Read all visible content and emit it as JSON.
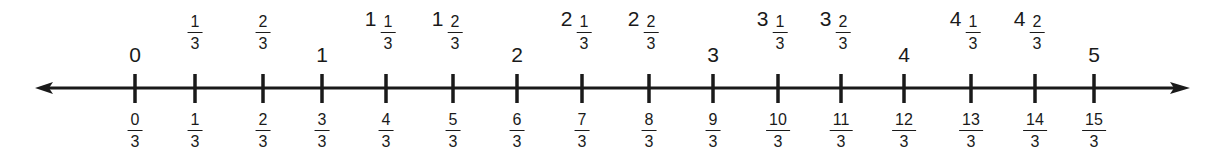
{
  "numberline": {
    "axis": {
      "y": 88,
      "x_start": 35,
      "x_end": 1190,
      "min": 0,
      "max": 5,
      "step": "1/3",
      "color": "#1a1a1a"
    },
    "ticks": [
      {
        "x": 135,
        "above": {
          "type": "whole",
          "whole": "0"
        },
        "below": {
          "num": "0",
          "den": "3"
        }
      },
      {
        "x": 195,
        "above": {
          "type": "frac",
          "num": "1",
          "den": "3"
        },
        "below": {
          "num": "1",
          "den": "3"
        }
      },
      {
        "x": 263,
        "above": {
          "type": "frac",
          "num": "2",
          "den": "3"
        },
        "below": {
          "num": "2",
          "den": "3"
        }
      },
      {
        "x": 322,
        "above": {
          "type": "whole",
          "whole": "1"
        },
        "below": {
          "num": "3",
          "den": "3"
        }
      },
      {
        "x": 386,
        "above": {
          "type": "mixed",
          "whole": "1",
          "num": "1",
          "den": "3"
        },
        "below": {
          "num": "4",
          "den": "3"
        }
      },
      {
        "x": 453,
        "above": {
          "type": "mixed",
          "whole": "1",
          "num": "2",
          "den": "3"
        },
        "below": {
          "num": "5",
          "den": "3"
        }
      },
      {
        "x": 517,
        "above": {
          "type": "whole",
          "whole": "2"
        },
        "below": {
          "num": "6",
          "den": "3"
        }
      },
      {
        "x": 582,
        "above": {
          "type": "mixed",
          "whole": "2",
          "num": "1",
          "den": "3"
        },
        "below": {
          "num": "7",
          "den": "3"
        }
      },
      {
        "x": 649,
        "above": {
          "type": "mixed",
          "whole": "2",
          "num": "2",
          "den": "3"
        },
        "below": {
          "num": "8",
          "den": "3"
        }
      },
      {
        "x": 713,
        "above": {
          "type": "whole",
          "whole": "3"
        },
        "below": {
          "num": "9",
          "den": "3"
        }
      },
      {
        "x": 778,
        "above": {
          "type": "mixed",
          "whole": "3",
          "num": "1",
          "den": "3"
        },
        "below": {
          "num": "10",
          "den": "3"
        }
      },
      {
        "x": 841,
        "above": {
          "type": "mixed",
          "whole": "3",
          "num": "2",
          "den": "3"
        },
        "below": {
          "num": "11",
          "den": "3"
        }
      },
      {
        "x": 904,
        "above": {
          "type": "whole",
          "whole": "4"
        },
        "below": {
          "num": "12",
          "den": "3"
        }
      },
      {
        "x": 971,
        "above": {
          "type": "mixed",
          "whole": "4",
          "num": "1",
          "den": "3"
        },
        "below": {
          "num": "13",
          "den": "3"
        }
      },
      {
        "x": 1035,
        "above": {
          "type": "mixed",
          "whole": "4",
          "num": "2",
          "den": "3"
        },
        "below": {
          "num": "14",
          "den": "3"
        }
      },
      {
        "x": 1094,
        "above": {
          "type": "whole",
          "whole": "5"
        },
        "below": {
          "num": "15",
          "den": "3"
        }
      }
    ]
  }
}
